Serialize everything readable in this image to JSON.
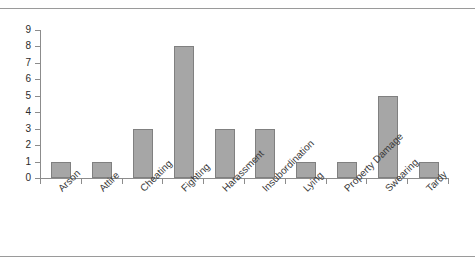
{
  "page": {
    "clipped_header_text": "",
    "background_color": "#ffffff",
    "rule_color": "#9a9a9a"
  },
  "chart_data": {
    "type": "bar",
    "title": "",
    "subtitle": "",
    "xlabel": "",
    "ylabel": "",
    "categories": [
      "Arson",
      "Attire",
      "Cheating",
      "Fighting",
      "Harassment",
      "Insubordination",
      "Lying",
      "Property Damage",
      "Swearing",
      "Tardy"
    ],
    "values": [
      1,
      1,
      3,
      8,
      3,
      3,
      1,
      1,
      5,
      1
    ],
    "ylim": [
      0,
      9
    ],
    "ytick_labels": [
      "0",
      "1",
      "2",
      "3",
      "4",
      "5",
      "6",
      "7",
      "8",
      "9"
    ],
    "ytick_values": [
      0,
      1,
      2,
      3,
      4,
      5,
      6,
      7,
      8,
      9
    ],
    "grid": false,
    "legend": false,
    "legend_position": "none",
    "bar_color": "#a6a6a6",
    "bar_border_color": "#808080",
    "axis_color": "#8c8c8c",
    "tick_label_color": "#2b2b2b",
    "category_label_rotation": -45
  }
}
